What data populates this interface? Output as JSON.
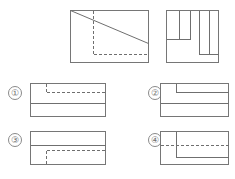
{
  "page": {
    "background_color": "#ffffff",
    "line_color": "#6f6f6f",
    "label_color": "#6d6d6d",
    "width": 235,
    "height": 179
  },
  "given_views": {
    "front_view": {
      "name": "front-view",
      "x": 70,
      "y": 10,
      "width": 78,
      "height": 52,
      "hidden_line_style": "dashed",
      "features": [
        {
          "type": "diagonal",
          "x1": 0,
          "y1": 0,
          "x2": 78,
          "y2": 33,
          "style": "solid"
        },
        {
          "type": "vertical",
          "x": 23,
          "y1": 0,
          "y2": 44,
          "style": "dashed"
        },
        {
          "type": "horizontal",
          "y": 44,
          "x1": 23,
          "x2": 78,
          "style": "dashed"
        }
      ]
    },
    "side_view": {
      "name": "side-view",
      "x": 166,
      "y": 10,
      "width": 52,
      "height": 52,
      "features": [
        {
          "type": "vertical",
          "x": 13,
          "y1": 0,
          "y2": 29,
          "style": "solid"
        },
        {
          "type": "horizontal",
          "y": 29,
          "x1": 0,
          "x2": 13,
          "style": "solid"
        },
        {
          "type": "vertical",
          "x": 24,
          "y1": 0,
          "y2": 29,
          "style": "solid"
        },
        {
          "type": "vertical",
          "x": 33,
          "y1": 0,
          "y2": 44,
          "style": "solid"
        },
        {
          "type": "horizontal",
          "y": 44,
          "x1": 33,
          "x2": 52,
          "style": "solid"
        },
        {
          "type": "vertical",
          "x": 43,
          "y1": 0,
          "y2": 44,
          "style": "solid"
        }
      ]
    }
  },
  "options": [
    {
      "id": "option-1",
      "label": "①",
      "label_x": 8,
      "label_y": 86,
      "box": {
        "x": 30,
        "y": 83,
        "width": 75,
        "height": 33
      },
      "features": [
        {
          "type": "vertical",
          "x": 16,
          "y1": 0,
          "y2": 9,
          "style": "dashed"
        },
        {
          "type": "horizontal",
          "y": 9,
          "x1": 16,
          "x2": 75,
          "style": "dashed"
        },
        {
          "type": "horizontal",
          "y": 20,
          "x1": 0,
          "x2": 75,
          "style": "solid"
        }
      ]
    },
    {
      "id": "option-2",
      "label": "②",
      "label_x": 148,
      "label_y": 86,
      "box": {
        "x": 160,
        "y": 83,
        "width": 68,
        "height": 33
      },
      "features": [
        {
          "type": "vertical",
          "x": 16,
          "y1": 0,
          "y2": 9,
          "style": "solid"
        },
        {
          "type": "horizontal",
          "y": 9,
          "x1": 16,
          "x2": 68,
          "style": "solid"
        },
        {
          "type": "horizontal",
          "y": 20,
          "x1": 0,
          "x2": 68,
          "style": "solid"
        }
      ]
    },
    {
      "id": "option-3",
      "label": "③",
      "label_x": 8,
      "label_y": 133,
      "box": {
        "x": 30,
        "y": 131,
        "width": 75,
        "height": 33
      },
      "features": [
        {
          "type": "horizontal",
          "y": 14,
          "x1": 0,
          "x2": 75,
          "style": "solid"
        },
        {
          "type": "vertical",
          "x": 16,
          "y1": 19,
          "y2": 33,
          "style": "dashed"
        },
        {
          "type": "horizontal",
          "y": 19,
          "x1": 16,
          "x2": 75,
          "style": "dashed"
        }
      ]
    },
    {
      "id": "option-4",
      "label": "④",
      "label_x": 148,
      "label_y": 133,
      "box": {
        "x": 160,
        "y": 131,
        "width": 68,
        "height": 33
      },
      "features": [
        {
          "type": "vertical",
          "x": 16,
          "y1": 0,
          "y2": 26,
          "style": "solid"
        },
        {
          "type": "horizontal",
          "y": 26,
          "x1": 16,
          "x2": 68,
          "style": "solid"
        },
        {
          "type": "horizontal",
          "y": 14,
          "x1": 0,
          "x2": 68,
          "style": "dashed"
        }
      ]
    }
  ]
}
